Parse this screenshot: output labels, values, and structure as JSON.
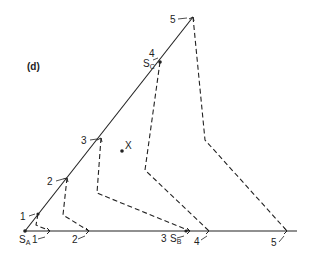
{
  "panel_label": "(d)",
  "colors": {
    "line": "#222222",
    "background": "#ffffff"
  },
  "nodes": {
    "sa": {
      "label": "S",
      "sub": "A"
    },
    "sb": {
      "label": "S",
      "sub": "B"
    },
    "sc": {
      "label": "S",
      "sub": "C"
    },
    "x": {
      "label": "X"
    }
  },
  "diagonal_ticks": [
    "1",
    "2",
    "3",
    "4",
    "5"
  ],
  "horizontal_ticks": [
    "1",
    "2",
    "3",
    "4",
    "5"
  ],
  "dashed_paths": [
    {
      "id": "1",
      "from_diagonal": "1",
      "to_horizontal": "1"
    },
    {
      "id": "2",
      "from_diagonal": "2",
      "to_horizontal": "2"
    },
    {
      "id": "3",
      "from_diagonal": "3",
      "to_horizontal": "3"
    },
    {
      "id": "4",
      "from_diagonal": "4",
      "to_horizontal": "4"
    },
    {
      "id": "5",
      "from_diagonal": "5",
      "to_horizontal": "5"
    }
  ]
}
